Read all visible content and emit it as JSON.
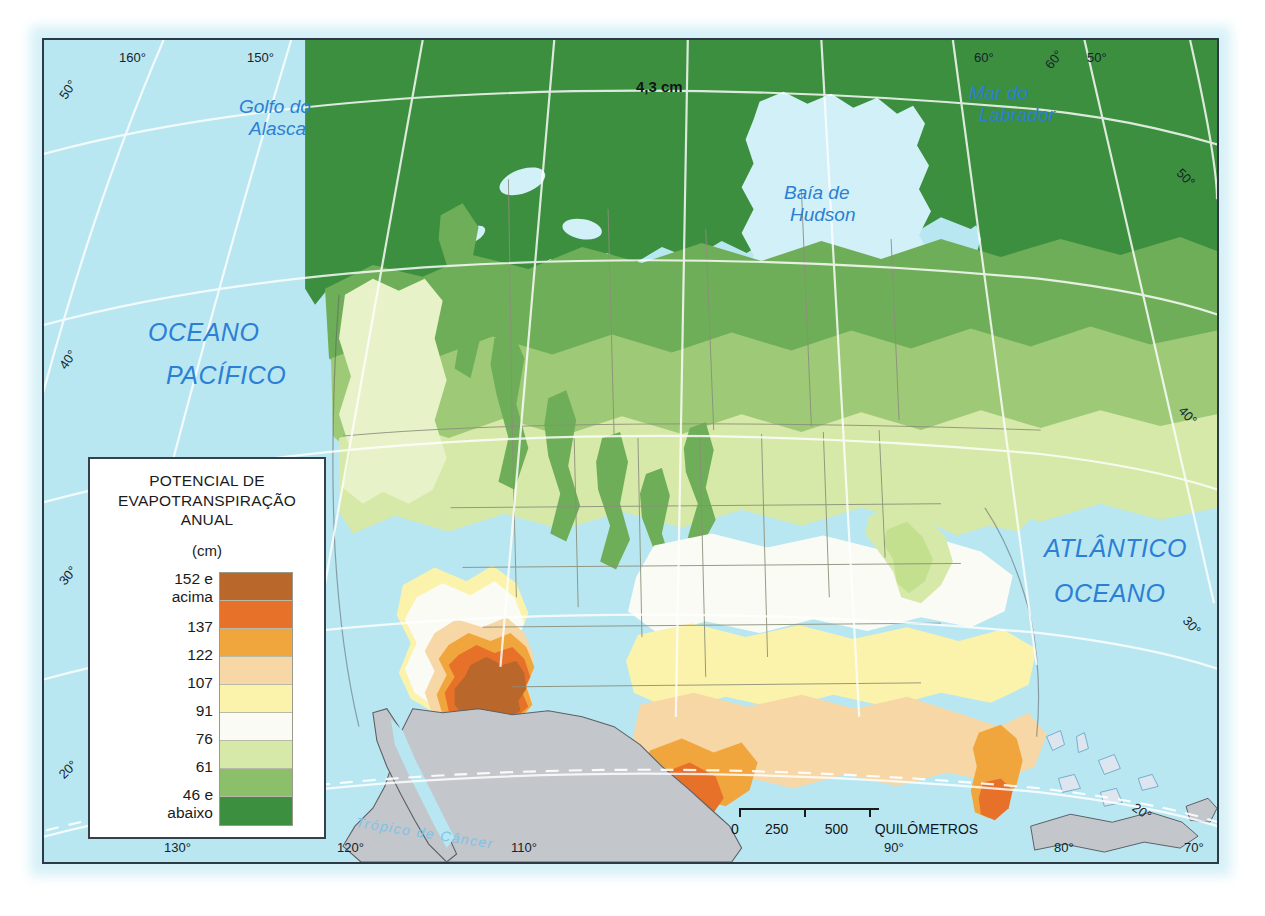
{
  "map": {
    "projection_note": "4,3 cm",
    "ocean_labels": [
      {
        "id": "pacific",
        "line1": "OCEANO",
        "line2": "PACÍFICO"
      },
      {
        "id": "atlantic",
        "line1": "ATLÂNTICO",
        "line2": "OCEANO"
      }
    ],
    "sea_labels": [
      {
        "id": "gulf-alaska",
        "line1": "Golfo do",
        "line2": "Alasca"
      },
      {
        "id": "hudson-bay",
        "line1": "Baía de",
        "line2": "Hudson"
      },
      {
        "id": "labrador-sea",
        "line1": "Mar do",
        "line2": "Labrador"
      }
    ],
    "tropic_label": "Trópico de Câncer",
    "graticule": {
      "top_labels": [
        "160°",
        "150°",
        "60°",
        "60°",
        "50°"
      ],
      "bottom_labels": [
        "130°",
        "120°",
        "110°",
        "90°",
        "80°",
        "70°"
      ],
      "left_labels": [
        "50°",
        "40°",
        "30°",
        "20°"
      ],
      "right_labels": [
        "50°",
        "40°",
        "30°",
        "20°"
      ]
    }
  },
  "legend": {
    "title_line1": "POTENCIAL DE",
    "title_line2": "EVAPOTRANSPIRAÇÃO",
    "title_line3": "ANUAL",
    "unit": "(cm)",
    "classes": [
      {
        "label_line1": "152 e",
        "label_line2": "acima",
        "color": "#b9672a"
      },
      {
        "label_line1": "137",
        "label_line2": "",
        "color": "#e8712a"
      },
      {
        "label_line1": "122",
        "label_line2": "",
        "color": "#f0a63c"
      },
      {
        "label_line1": "107",
        "label_line2": "",
        "color": "#f7d7a5"
      },
      {
        "label_line1": "91",
        "label_line2": "",
        "color": "#fbf3ab"
      },
      {
        "label_line1": "76",
        "label_line2": "",
        "color": "#fbfbf6"
      },
      {
        "label_line1": "61",
        "label_line2": "",
        "color": "#d7e9a8"
      },
      {
        "label_line1": "46 e",
        "label_line2": "abaixo",
        "color": "#8cbf6a"
      },
      {
        "label_line1": "",
        "label_line2": "",
        "color": "#3c8f3f"
      }
    ],
    "class_labels_ordered": [
      "152 e acima",
      "137",
      "122",
      "107",
      "91",
      "76",
      "61",
      "46 e abaixo"
    ]
  },
  "scale": {
    "ticks": [
      "0",
      "250",
      "500"
    ],
    "unit": "QUILÔMETROS"
  },
  "colors": {
    "ocean": "#b8e7f2",
    "land_dark_green": "#3c8f3f",
    "land_mid_green": "#6fae58",
    "land_light_green": "#9ec977",
    "land_pale_green": "#d7e9a8",
    "white_zone": "#fbfbf6",
    "pale_yellow": "#fbf3ab",
    "light_tan": "#f7d7a5",
    "orange": "#f0a63c",
    "deep_orange": "#e8712a",
    "brown": "#b9672a",
    "mexico_gray": "#c3c6cb",
    "border_gray": "#8a8f7a",
    "label_blue": "#2b7fd4",
    "frame": "#2d3a44"
  }
}
